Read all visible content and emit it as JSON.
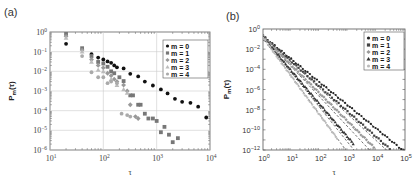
{
  "figure": {
    "panel_a_label": "(a)",
    "panel_b_label": "(b)"
  },
  "chart_data": [
    {
      "panel": "(a)",
      "type": "scatter",
      "xscale": "log",
      "yscale": "log",
      "xlabel": "τ",
      "ylabel": "P_m(τ)",
      "xlim": [
        10,
        10000
      ],
      "ylim": [
        1e-06,
        1
      ],
      "xticks": [
        "10^1",
        "10^2",
        "10^3",
        "10^4"
      ],
      "yticks": [
        "10^0",
        "10^-1",
        "10^-2",
        "10^-3",
        "10^-4",
        "10^-5",
        "10^-6"
      ],
      "grid": true,
      "legend_position": "upper right",
      "legend": [
        "m = 0",
        "m = 1",
        "m = 2",
        "m = 3",
        "m = 4"
      ],
      "series": [
        {
          "name": "m = 0",
          "color": "#111111",
          "marker": "circle",
          "x": [
            20,
            60,
            80,
            100,
            120,
            140,
            160,
            180,
            240,
            320,
            450,
            600,
            850,
            1200,
            1600,
            2200,
            3000,
            4300,
            6000,
            8500
          ],
          "y": [
            0.25,
            0.075,
            0.05,
            0.04,
            0.032,
            0.027,
            0.02,
            0.016,
            0.014,
            0.0075,
            0.0055,
            0.003,
            0.0019,
            0.0012,
            0.00075,
            0.0004,
            0.00028,
            0.00025,
            0.00016,
            4.5e-05
          ]
        },
        {
          "name": "m = 1",
          "color": "#777777",
          "marker": "square",
          "x": [
            20,
            40,
            60,
            80,
            100,
            120,
            140,
            160,
            200,
            240,
            320,
            360,
            450,
            500,
            600,
            700,
            850,
            1000,
            1200,
            1400,
            1700,
            2000,
            2500
          ],
          "y": [
            0.8,
            0.15,
            0.06,
            0.03,
            0.025,
            0.017,
            0.01,
            0.008,
            0.005,
            0.0032,
            0.0006,
            0.0006,
            0.0002,
            0.0002,
            7e-05,
            4e-05,
            4e-05,
            3e-05,
            8e-06,
            1.5e-05,
            6e-06,
            2.5e-06,
            4e-06
          ]
        },
        {
          "name": "m = 2",
          "color": "#999999",
          "marker": "diamond",
          "x": [
            20,
            40,
            60,
            80,
            100,
            120,
            140,
            160,
            180,
            240,
            280,
            320,
            400,
            450
          ],
          "y": [
            0.6,
            0.12,
            0.04,
            0.02,
            0.015,
            0.008,
            0.006,
            0.004,
            0.003,
            0.002,
            0.001,
            0.0002,
            5e-05,
            4e-05
          ]
        },
        {
          "name": "m = 3",
          "color": "#bbbbbb",
          "marker": "triangle",
          "x": [
            20,
            40,
            60,
            80,
            100,
            140,
            180,
            240,
            280
          ],
          "y": [
            0.5,
            0.1,
            0.03,
            0.012,
            0.01,
            0.004,
            0.002,
            0.0012,
            0.0008
          ]
        },
        {
          "name": "m = 4",
          "color": "#aaaaaa",
          "marker": "circle-light",
          "x": [
            40,
            60,
            80,
            100,
            120,
            140,
            180,
            220,
            280,
            320
          ],
          "y": [
            0.06,
            0.009,
            0.005,
            0.005,
            0.0025,
            0.003,
            0.0025,
            7e-05,
            6e-05,
            5e-05
          ]
        }
      ]
    },
    {
      "panel": "(b)",
      "type": "scatter",
      "xscale": "log",
      "yscale": "log",
      "xlabel": "τ",
      "ylabel": "P_m(τ)",
      "xlim": [
        1,
        100000
      ],
      "ylim": [
        1e-12,
        1
      ],
      "xticks": [
        "10^0",
        "10^1",
        "10^2",
        "10^3",
        "10^4",
        "10^5"
      ],
      "yticks": [
        "10^0",
        "10^-2",
        "10^-4",
        "10^-6",
        "10^-8",
        "10^-10",
        "10^-12"
      ],
      "grid": false,
      "legend_position": "upper right",
      "legend": [
        "m = 0",
        "m = 1",
        "m = 2",
        "m = 3",
        "m = 4"
      ],
      "series": [
        {
          "name": "m = 0",
          "color": "#222222",
          "marker": "circle",
          "slope": -2.3,
          "y_at_1": 0.2,
          "x_end": 90000
        },
        {
          "name": "m = 1",
          "color": "#444444",
          "marker": "square",
          "slope": -2.5,
          "y_at_1": 0.2,
          "x_end": 50000
        },
        {
          "name": "m = 2",
          "color": "#999999",
          "marker": "diamond",
          "slope": -2.8,
          "y_at_1": 0.18,
          "x_end": 8000
        },
        {
          "name": "m = 3",
          "color": "#333333",
          "marker": "triangle",
          "slope": -3.3,
          "y_at_1": 0.16,
          "x_end": 1500
        },
        {
          "name": "m = 4",
          "color": "#bbbbbb",
          "marker": "circle-light",
          "slope": -3.8,
          "y_at_1": 0.15,
          "x_end": 400
        }
      ],
      "fit_lines": [
        {
          "style": "dashed",
          "slope": -2.3,
          "y_at_1": 0.2
        },
        {
          "style": "dashed",
          "slope": -2.6,
          "y_at_1": 0.2
        },
        {
          "style": "dashed",
          "slope": -3.0,
          "y_at_1": 0.18
        },
        {
          "style": "dashed",
          "slope": -3.5,
          "y_at_1": 0.16
        },
        {
          "style": "dashed",
          "slope": -4.2,
          "y_at_1": 0.15
        }
      ]
    }
  ]
}
